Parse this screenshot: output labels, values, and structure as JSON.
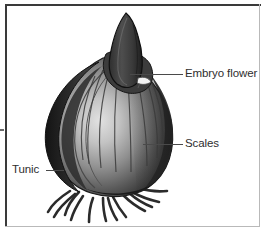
{
  "figure": {
    "style": "grayscale-botanical-drawing",
    "background_color": "#ffffff",
    "frame_color": "#3a3a3a",
    "frame_color_light": "#b9b9b9"
  },
  "labels": {
    "embryo_flower": "Embryo flower",
    "scales": "Scales",
    "tunic": "Tunic"
  },
  "illustration": {
    "parts": [
      "embryo-flower-shoot",
      "scales",
      "tunic",
      "roots",
      "basal-plate"
    ],
    "palette": {
      "shoot_dark": "#3b3b3b",
      "shoot_mid": "#555555",
      "bulb_highlight": "#d8d8d8",
      "bulb_mid": "#8e8e8e",
      "bulb_dark": "#3a3a3a",
      "tunic_dark": "#222222",
      "root_color": "#2b2b2b",
      "outline": "#1a1a1a"
    }
  }
}
